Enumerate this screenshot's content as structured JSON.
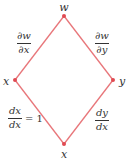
{
  "diagram": {
    "type": "chain-rule-tree",
    "edge_color": "#e8767a",
    "node_color": "#e04a52",
    "nodes": {
      "top": {
        "label": "w",
        "x": 64,
        "y": 16
      },
      "left": {
        "label": "x",
        "x": 15,
        "y": 80
      },
      "right": {
        "label": "y",
        "x": 113,
        "y": 80
      },
      "bottom": {
        "label": "x",
        "x": 64,
        "y": 144
      }
    },
    "edges": {
      "top_left": {
        "num": "∂w",
        "den": "∂x"
      },
      "top_right": {
        "num": "∂w",
        "den": "∂y"
      },
      "left_bottom": {
        "num": "dx",
        "den": "dx",
        "suffix": "= 1"
      },
      "right_bottom": {
        "num": "dy",
        "den": "dx"
      }
    }
  }
}
